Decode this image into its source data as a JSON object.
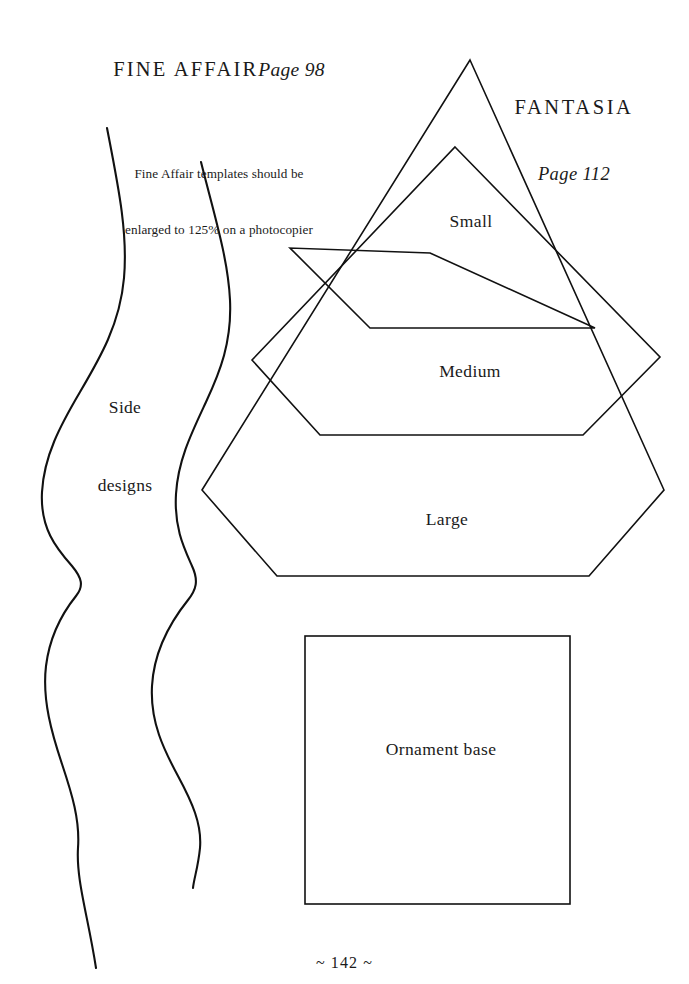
{
  "page": {
    "background_color": "#ffffff",
    "ink_color": "#111111",
    "footer": "~ 142 ~"
  },
  "headings": {
    "fine_affair": {
      "title": "FINE AFFAIR",
      "page_reference": "Page 98",
      "note_line_1": "Fine Affair templates should be",
      "note_line_2": "enlarged to 125% on a photocopier"
    },
    "fantasia": {
      "title": "FANTASIA",
      "page_reference": "Page 112"
    }
  },
  "labels": {
    "side_designs_line_1": "Side",
    "side_designs_line_2": "designs",
    "small": "Small",
    "medium": "Medium",
    "large": "Large",
    "ornament_base": "Ornament base"
  },
  "templates": {
    "side_designs": [
      {
        "name": "side-design-curve-left",
        "shape": "serpentine-wave",
        "top_point": [
          107,
          128
        ],
        "bottom_point": [
          96,
          968
        ]
      },
      {
        "name": "side-design-curve-right",
        "shape": "serpentine-wave",
        "top_point": [
          201,
          162
        ],
        "bottom_point": [
          193,
          888
        ]
      }
    ],
    "pentagons": [
      {
        "name": "small",
        "label": "Small",
        "apex": [
          430,
          253
        ],
        "left_vertex": [
          290,
          248
        ],
        "right_vertex": [
          595,
          328
        ],
        "bottom_left": [
          370,
          328
        ],
        "bottom_right": [
          585,
          328
        ]
      },
      {
        "name": "medium",
        "label": "Medium",
        "apex": [
          455,
          147
        ],
        "left_vertex": [
          252,
          360
        ],
        "right_vertex": [
          660,
          357
        ],
        "bottom_left": [
          320,
          435
        ],
        "bottom_right": [
          583,
          435
        ]
      },
      {
        "name": "large",
        "label": "Large",
        "apex": [
          470,
          60
        ],
        "left_vertex": [
          202,
          490
        ],
        "right_vertex": [
          664,
          490
        ],
        "bottom_left": [
          277,
          576
        ],
        "bottom_right": [
          589,
          576
        ]
      }
    ],
    "ornament_base": {
      "name": "ornament-base-square",
      "label": "Ornament base",
      "top_left": [
        305,
        636
      ],
      "bottom_right": [
        570,
        904
      ],
      "width_px": 265,
      "height_px": 268
    }
  }
}
